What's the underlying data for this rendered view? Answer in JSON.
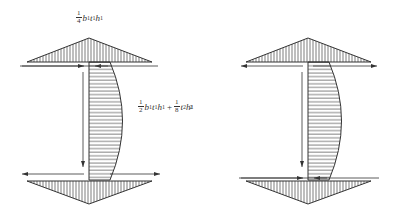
{
  "figure": {
    "colors": {
      "stroke": "#333333",
      "hatch": "#444444",
      "background": "#ffffff"
    }
  },
  "left_diagram": {
    "top_label": {
      "frac_num": "1",
      "frac_den": "4",
      "terms": [
        "b",
        "1",
        "t",
        "1",
        "h",
        "1"
      ]
    },
    "web_label": {
      "frac1_num": "1",
      "frac1_den": "2",
      "term1": [
        "b",
        "1",
        "t",
        "1",
        "h",
        "1"
      ],
      "plus": "+",
      "frac2_num": "1",
      "frac2_den": "8",
      "term2": [
        "t",
        "2",
        "h",
        "1",
        "2"
      ]
    }
  },
  "right_diagram": {}
}
